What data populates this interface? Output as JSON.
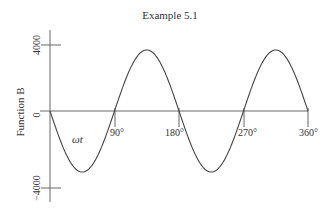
{
  "chart_data": {
    "type": "line",
    "title": "Example 5.1",
    "xlabel": "ωt",
    "ylabel": "Function B",
    "x_ticks": [
      "90°",
      "180°",
      "270°",
      "360°"
    ],
    "y_ticks": [
      "4000",
      "0",
      "−4000"
    ],
    "ylim": [
      -4000,
      4000
    ],
    "xlim": [
      0,
      360
    ],
    "grid": false,
    "legend": null,
    "series": [
      {
        "name": "Function B",
        "description": "Negative sine wave with two full cycles over 0° to 360° (period 180°), amplitude ~3700",
        "amplitude": 3700,
        "x": [
          0,
          22.5,
          45,
          67.5,
          90,
          112.5,
          135,
          157.5,
          180,
          202.5,
          225,
          247.5,
          270,
          292.5,
          315,
          337.5,
          360
        ],
        "values": [
          0,
          -2616,
          -3700,
          -2616,
          0,
          2616,
          3700,
          2616,
          0,
          -2616,
          -3700,
          -2616,
          0,
          2616,
          3700,
          2616,
          0
        ]
      }
    ]
  }
}
